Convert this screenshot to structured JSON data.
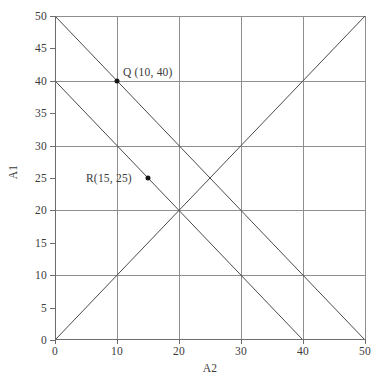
{
  "chart_data": {
    "type": "line",
    "title": "",
    "xlabel": "A2",
    "ylabel": "A1",
    "xlim": [
      0,
      50
    ],
    "ylim": [
      0,
      50
    ],
    "grid": true,
    "legend": "none",
    "x_ticks": [
      0,
      10,
      20,
      30,
      40,
      50
    ],
    "x_tick_labels": [
      "0",
      "10",
      "20",
      "30",
      "40",
      "50"
    ],
    "y_ticks": [
      0,
      5,
      10,
      15,
      20,
      25,
      30,
      35,
      40,
      45,
      50
    ],
    "y_tick_labels": [
      "0",
      "5",
      "10",
      "15",
      "20",
      "25",
      "30",
      "35",
      "40",
      "45",
      "50"
    ],
    "gridlines_x": [
      10,
      20,
      30,
      40,
      50
    ],
    "gridlines_y": [
      10,
      20,
      30,
      40,
      50
    ],
    "series": [
      {
        "name": "A1 + A2 = 50",
        "x": [
          0,
          50
        ],
        "y": [
          50,
          0
        ],
        "color": "#4a4a4a"
      },
      {
        "name": "A1 + A2 = 40",
        "x": [
          0,
          40
        ],
        "y": [
          40,
          0
        ],
        "color": "#4a4a4a"
      },
      {
        "name": "A1 = A2",
        "x": [
          0,
          50
        ],
        "y": [
          0,
          50
        ],
        "color": "#4a4a4a"
      }
    ],
    "points": [
      {
        "name": "Q",
        "x": 10,
        "y": 40,
        "label": "Q (10, 40)",
        "label_dx": 6,
        "label_dy": -9
      },
      {
        "name": "R",
        "x": 15,
        "y": 25,
        "label": "R(15, 25)",
        "label_dx": -62,
        "label_dy": 0
      }
    ]
  },
  "colors": {
    "grid": "#8e8e8e",
    "axis": "#6d6d6d",
    "line": "#4a4a4a",
    "point": "#151515",
    "text": "#3a3a3a",
    "background": "#ffffff"
  }
}
